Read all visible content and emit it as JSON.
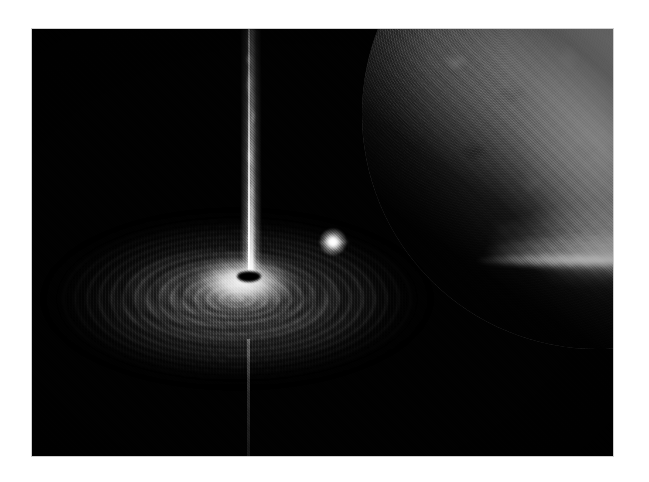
{
  "page": {
    "background_color": "#ffffff",
    "width": 649,
    "height": 482
  },
  "illustration": {
    "alt_text": "Artist's illustration of a black hole X-ray binary: a black hole surrounded by a bright accretion disk with a narrow relativistic jet, drawing a stream of gas from a large companion star.",
    "frame": {
      "left": 32,
      "top": 29,
      "width": 581,
      "height": 427,
      "border_color": "#cfcfcf",
      "background_color": "#010101"
    },
    "palette": {
      "space_black": "#010101",
      "disk_bright": "#ffffff",
      "disk_mid_gray": "#9a9a9a",
      "disk_dark_lane": "#1a1a1a",
      "star_bright": "#f2f2f2",
      "star_shadow": "#000000",
      "jet_white": "#ffffff",
      "margin_white": "#ffffff"
    },
    "objects": [
      {
        "name": "companion-star",
        "label": "Companion star",
        "description": "Large mottled stellar photosphere filling the right side of the frame, bright on its upper-right limb and fading into shadow toward the lower left."
      },
      {
        "name": "accretion-stream",
        "label": "Accretion stream",
        "description": "Wedge of glowing gas flowing leftward from the companion star toward the black hole."
      },
      {
        "name": "hotspot",
        "label": "Impact hot spot",
        "description": "Bright point where the gas stream strikes the outer edge of the accretion disk."
      },
      {
        "name": "accretion-disk",
        "label": "Accretion disk",
        "description": "Wide elliptical disk of concentric glowing rings and dark spiral lanes seen nearly edge-on, brightest at its inner region."
      },
      {
        "name": "black-hole",
        "label": "Black hole",
        "description": "Small dark elliptical shadow at the centre of the accretion disk."
      },
      {
        "name": "relativistic-jet",
        "label": "Relativistic jet",
        "description": "Narrow, wispy, knotted beam of light rising vertically from the black hole to the top edge of the frame."
      },
      {
        "name": "counter-jet",
        "label": "Counter-jet",
        "description": "Very faint vertical thread descending from the disk toward the bottom of the frame."
      }
    ]
  }
}
